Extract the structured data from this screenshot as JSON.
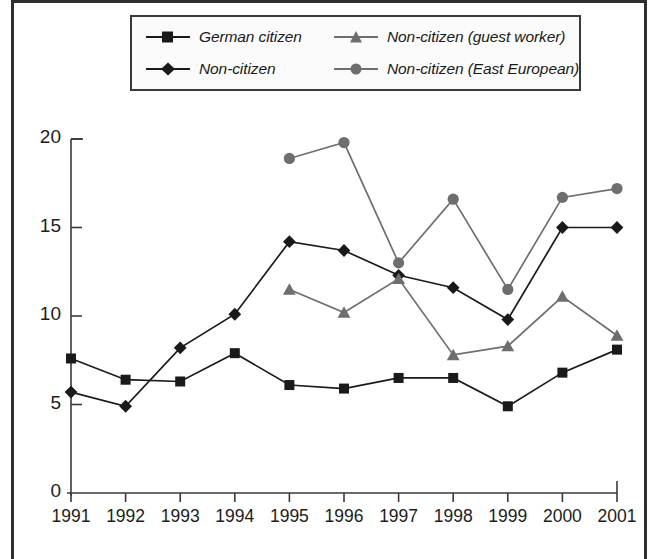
{
  "figure": {
    "axis_color": "#3a3a3a",
    "frame_color": "#2e2e2e"
  },
  "legend": {
    "entries": [
      {
        "label": "German citizen",
        "marker": "square-marker",
        "color": "#1a1a1a"
      },
      {
        "label": "Non-citizen (guest worker)",
        "marker": "triangle-marker",
        "color": "#6e6e6e"
      },
      {
        "label": "Non-citizen",
        "marker": "diamond-marker",
        "color": "#1a1a1a"
      },
      {
        "label": "Non-citizen (East European)",
        "marker": "circle-marker",
        "color": "#6e6e6e"
      }
    ]
  },
  "axes": {
    "y_ticks": [
      "0",
      "5",
      "10",
      "15",
      "20"
    ],
    "x_ticks": [
      "1991",
      "1992",
      "1993",
      "1994",
      "1995",
      "1996",
      "1997",
      "1998",
      "1999",
      "2000",
      "2001"
    ]
  },
  "chart_data": {
    "type": "line",
    "title": "",
    "subtitle": "",
    "xlabel": "",
    "ylabel": "",
    "xlim": [
      1991,
      2001
    ],
    "ylim": [
      0,
      20
    ],
    "grid": false,
    "legend_position": "top",
    "x": [
      1991,
      1992,
      1993,
      1994,
      1995,
      1996,
      1997,
      1998,
      1999,
      2000,
      2001
    ],
    "series": [
      {
        "name": "German citizen",
        "marker": "square-marker",
        "color": "#1a1a1a",
        "x": [
          1991,
          1992,
          1993,
          1994,
          1995,
          1996,
          1997,
          1998,
          1999,
          2000,
          2001
        ],
        "values": [
          7.6,
          6.4,
          6.3,
          7.9,
          6.1,
          5.9,
          6.5,
          6.5,
          4.9,
          6.8,
          8.1
        ]
      },
      {
        "name": "Non-citizen",
        "marker": "diamond-marker",
        "color": "#1a1a1a",
        "x": [
          1991,
          1992,
          1993,
          1994,
          1995,
          1996,
          1997,
          1998,
          1999,
          2000,
          2001
        ],
        "values": [
          5.7,
          4.9,
          8.2,
          10.1,
          14.2,
          13.7,
          12.3,
          11.6,
          9.8,
          15.0,
          15.0
        ]
      },
      {
        "name": "Non-citizen (guest worker)",
        "marker": "triangle-marker",
        "color": "#6e6e6e",
        "x": [
          1995,
          1996,
          1997,
          1998,
          1999,
          2000,
          2001
        ],
        "values": [
          11.5,
          10.2,
          12.1,
          7.8,
          8.3,
          11.1,
          8.9
        ]
      },
      {
        "name": "Non-citizen (East European)",
        "marker": "circle-marker",
        "color": "#6e6e6e",
        "x": [
          1995,
          1996,
          1997,
          1998,
          1999,
          2000,
          2001
        ],
        "values": [
          18.9,
          19.8,
          13.0,
          16.6,
          11.5,
          16.7,
          17.2
        ]
      }
    ]
  }
}
